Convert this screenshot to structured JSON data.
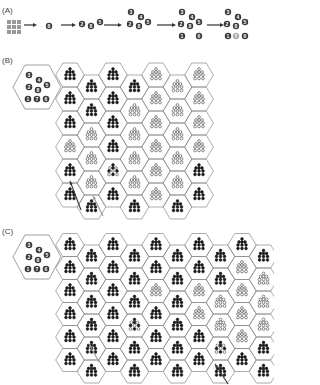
{
  "panels": {
    "a": {
      "label": "(A)",
      "stages": [
        {
          "cells": [
            "8"
          ]
        },
        {
          "cells": [
            "2",
            "8",
            "5"
          ]
        },
        {
          "cells": [
            "3",
            "4",
            "2",
            "8",
            "5"
          ]
        },
        {
          "cells": [
            "3",
            "4",
            "2",
            "8",
            "5",
            "1",
            "6"
          ]
        },
        {
          "cells": [
            "3",
            "4",
            "2",
            "8",
            "5",
            "1",
            "7",
            "6"
          ],
          "highlight": "7"
        }
      ]
    },
    "b": {
      "label": "(B)",
      "inset_numbers": [
        "3",
        "4",
        "2",
        "8",
        "5",
        "1",
        "7",
        "6"
      ],
      "grid": [
        "FFFFOOO",
        "FFFOOOO",
        "FOFOOOO",
        "OOFOOOO",
        "FOMOOOF",
        "FFFFOFF"
      ],
      "arrows": [
        {
          "color": "#333333",
          "from": [
            81,
            210
          ],
          "to": [
            70,
            181
          ]
        },
        {
          "color": "#999999",
          "from": [
            103,
            216
          ],
          "to": [
            93,
            196
          ]
        }
      ]
    },
    "c": {
      "label": "(C)",
      "inset_numbers": [
        "3",
        "4",
        "2",
        "8",
        "5",
        "1",
        "7",
        "6"
      ],
      "grid": [
        "FFFFFFFFFF",
        "FFFFFFFFOO",
        "FFFFOFOOOO",
        "FFFMFFOOOO",
        "FFFFFFFMOF",
        "FFFFFFFFFF"
      ],
      "arrows": [
        {
          "color": "#999999",
          "from": [
            99,
            362
          ],
          "to": [
            89,
            344
          ]
        },
        {
          "color": "#333333",
          "from": [
            228,
            384
          ],
          "to": [
            215,
            364
          ]
        }
      ]
    }
  },
  "colors": {
    "dot": "#1a1a1a",
    "hex": "#888888",
    "badge": "#3a3a3a",
    "highlight_badge": "#aaaaaa",
    "square": "#999999"
  }
}
